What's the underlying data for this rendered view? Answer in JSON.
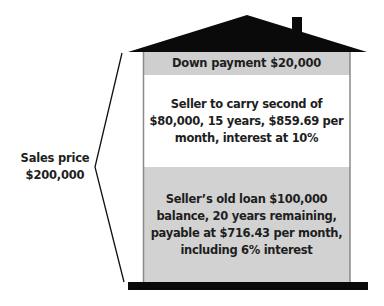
{
  "diagram": {
    "type": "house-financing-breakdown",
    "sales_price": {
      "line1": "Sales price",
      "line2": "$200,000"
    },
    "bands": [
      {
        "id": "down-payment",
        "lines": [
          "Down payment $20,000"
        ],
        "fill": "#cfcfcf"
      },
      {
        "id": "seller-second",
        "lines": [
          "Seller to carry second of",
          "$80,000, 15 years, $859.69 per",
          "month, interest at 10%"
        ],
        "fill": "#ffffff"
      },
      {
        "id": "seller-old-loan",
        "lines": [
          "Seller’s old loan $100,000",
          "balance, 20 years remaining,",
          "payable at $716.43 per month,",
          "including 6% interest"
        ],
        "fill": "#d2d2d2"
      }
    ],
    "colors": {
      "roof": "#0a0a0a",
      "base": "#0a0a0a",
      "wall": "#8a8a8a",
      "brace": "#111111"
    }
  }
}
